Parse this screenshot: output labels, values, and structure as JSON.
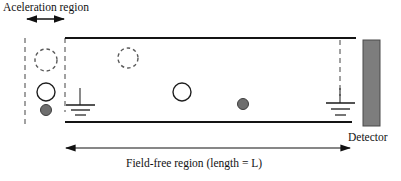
{
  "figure": {
    "type": "time-of-flight-mass-spectrometer-schematic",
    "width": 401,
    "height": 181,
    "background": "#ffffff"
  },
  "labels": {
    "acceleration_region": "Aceleration region",
    "field_free_region": "Field-free region (length = L)",
    "detector": "Detector"
  },
  "colors": {
    "stroke": "#1a1a1a",
    "dashed_stroke": "#555555",
    "particle_fill": "#6e6e6e",
    "detector_fill": "#7d7d7d",
    "detector_stroke": "#4a4a4a",
    "arrow": "#111111",
    "text": "#121212",
    "background": "#ffffff"
  },
  "geometry": {
    "accel_region": {
      "left_boundary_x": 25,
      "right_boundary_x": 65,
      "top_y": 38,
      "bottom_y": 125
    },
    "flight_tube": {
      "top_line": {
        "x1": 65,
        "y1": 38,
        "x2": 356,
        "y2": 38
      },
      "bottom_line": {
        "x1": 65,
        "y1": 122,
        "x2": 352,
        "y2": 122
      }
    },
    "detector_rect": {
      "x": 363,
      "y": 40,
      "width": 17,
      "height": 86
    },
    "accel_arrow": {
      "x1": 26,
      "y1": 19,
      "x2": 65,
      "y2": 19
    },
    "length_arrow": {
      "x1": 64,
      "y1": 148,
      "x2": 351,
      "y2": 148
    },
    "grid_left_x": 80,
    "grid_right_x": 340
  },
  "particles": [
    {
      "name": "dashed-particle-accel-upper",
      "cx": 46,
      "cy": 60,
      "r": 11,
      "style": "dashed-outline"
    },
    {
      "name": "open-particle-accel-lower",
      "cx": 46,
      "cy": 92,
      "r": 9,
      "style": "solid-outline"
    },
    {
      "name": "filled-particle-accel-bottom",
      "cx": 46,
      "cy": 110,
      "r": 5.5,
      "style": "filled"
    },
    {
      "name": "dashed-particle-drift-1",
      "cx": 128,
      "cy": 58,
      "r": 10,
      "style": "dashed-outline"
    },
    {
      "name": "open-particle-drift-2",
      "cx": 182,
      "cy": 92,
      "r": 9,
      "style": "solid-outline"
    },
    {
      "name": "filled-particle-drift-3",
      "cx": 243,
      "cy": 104,
      "r": 5.5,
      "style": "filled"
    }
  ],
  "grids": [
    {
      "name": "extraction-grid-left",
      "x": 80,
      "stem_top": 86,
      "stem_bottom": 108,
      "bars": [
        22,
        14,
        8
      ]
    },
    {
      "name": "extraction-grid-right",
      "x": 340,
      "stem_top": 86,
      "stem_bottom": 108,
      "bars": [
        22,
        14,
        8
      ]
    }
  ]
}
